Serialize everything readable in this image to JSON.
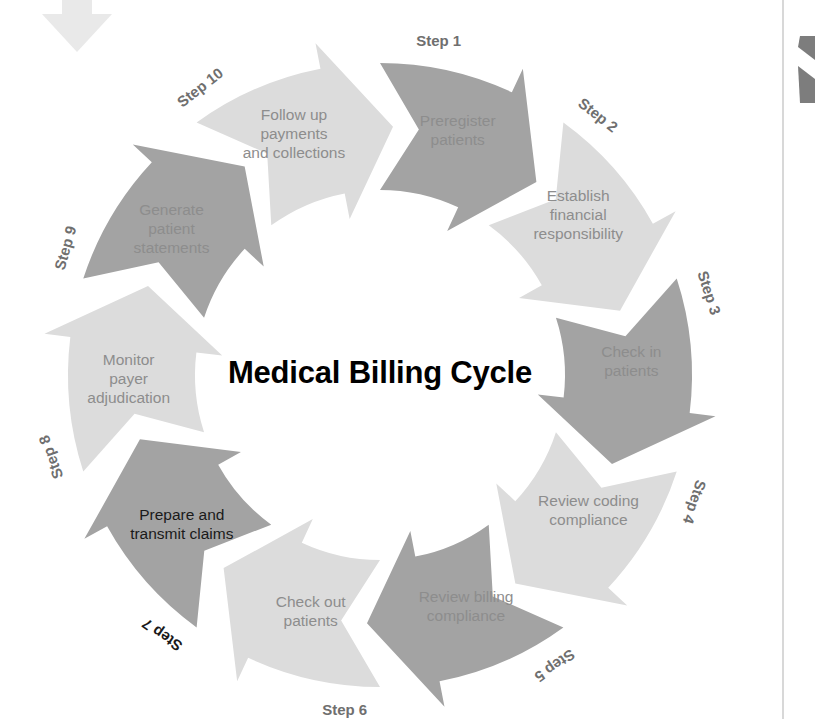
{
  "diagram": {
    "title": "Medical Billing Cycle",
    "type": "circular-process",
    "center": {
      "x": 380,
      "y": 375
    },
    "radius_outer": 312,
    "radius_inner": 185,
    "colors": {
      "arrow_dark": "#a3a3a3",
      "arrow_light": "#dcdcdc",
      "label_gray": "#8d8d8d",
      "label_dark": "#1a1a1a",
      "title": "#000000",
      "decor_gray": "#e8e8e8",
      "decor_dark": "#7d7d7d",
      "rule": "#cccccc",
      "background": "#ffffff"
    },
    "steps": [
      {
        "tag": "Step 1",
        "label_line1": "Preregister",
        "label_line2": "patients",
        "label_line3": "",
        "tone": "dark",
        "text_emphasis": "normal",
        "tag_emphasis": "normal",
        "start_deg": -90,
        "end_deg": -54,
        "label_deg": -72,
        "tag_deg": -80,
        "tag_rotate": 0
      },
      {
        "tag": "Step 2",
        "label_line1": "Establish",
        "label_line2": "financial",
        "label_line3": "responsibility",
        "tone": "light",
        "text_emphasis": "normal",
        "tag_emphasis": "normal",
        "start_deg": -54,
        "end_deg": -18,
        "label_deg": -38,
        "tag_deg": -50,
        "tag_rotate": 38
      },
      {
        "tag": "Step 3",
        "label_line1": "Check in",
        "label_line2": "patients",
        "label_line3": "",
        "tone": "dark",
        "text_emphasis": "normal",
        "tag_emphasis": "normal",
        "start_deg": -18,
        "end_deg": 18,
        "label_deg": -2,
        "tag_deg": -14,
        "tag_rotate": 72
      },
      {
        "tag": "Step 4",
        "label_line1": "Review coding",
        "label_line2": "compliance",
        "label_line3": "",
        "tone": "light",
        "text_emphasis": "normal",
        "tag_emphasis": "normal",
        "start_deg": 18,
        "end_deg": 54,
        "label_deg": 34,
        "tag_deg": 22,
        "tag_rotate": 108
      },
      {
        "tag": "Step 5",
        "label_line1": "Review billing",
        "label_line2": "compliance",
        "label_line3": "",
        "tone": "dark",
        "text_emphasis": "normal",
        "tag_emphasis": "normal",
        "start_deg": 54,
        "end_deg": 90,
        "label_deg": 70,
        "tag_deg": 59,
        "tag_rotate": 145
      },
      {
        "tag": "Step 6",
        "label_line1": "Check out",
        "label_line2": "patients",
        "label_line3": "",
        "tone": "light",
        "text_emphasis": "normal",
        "tag_emphasis": "normal",
        "start_deg": 90,
        "end_deg": 126,
        "label_deg": 106,
        "tag_deg": 96,
        "tag_rotate": 0
      },
      {
        "tag": "Step 7",
        "label_line1": "Prepare and",
        "label_line2": "transmit claims",
        "label_line3": "",
        "tone": "dark",
        "text_emphasis": "dark",
        "tag_emphasis": "dark",
        "start_deg": 126,
        "end_deg": 162,
        "label_deg": 142,
        "tag_deg": 130,
        "tag_rotate": -145
      },
      {
        "tag": "Step 8",
        "label_line1": "Monitor",
        "label_line2": "payer",
        "label_line3": "adjudication",
        "tone": "light",
        "text_emphasis": "normal",
        "tag_emphasis": "normal",
        "start_deg": 162,
        "end_deg": 198,
        "label_deg": 178,
        "tag_deg": 166,
        "tag_rotate": -110
      },
      {
        "tag": "Step 9",
        "label_line1": "Generate",
        "label_line2": "patient",
        "label_line3": "statements",
        "tone": "dark",
        "text_emphasis": "normal",
        "tag_emphasis": "normal",
        "start_deg": 198,
        "end_deg": 234,
        "label_deg": 214,
        "tag_deg": 202,
        "tag_rotate": -74
      },
      {
        "tag": "Step 10",
        "label_line1": "Follow up",
        "label_line2": "payments",
        "label_line3": "and collections",
        "tone": "light",
        "text_emphasis": "normal",
        "tag_emphasis": "normal",
        "start_deg": 234,
        "end_deg": 270,
        "label_deg": 250,
        "tag_deg": 238,
        "tag_rotate": -38
      }
    ]
  },
  "decorations": {
    "top_left_arrow": "down-arrow-icon",
    "right_chevrons": "double-chevron-icon",
    "right_rule": "vertical-rule"
  }
}
